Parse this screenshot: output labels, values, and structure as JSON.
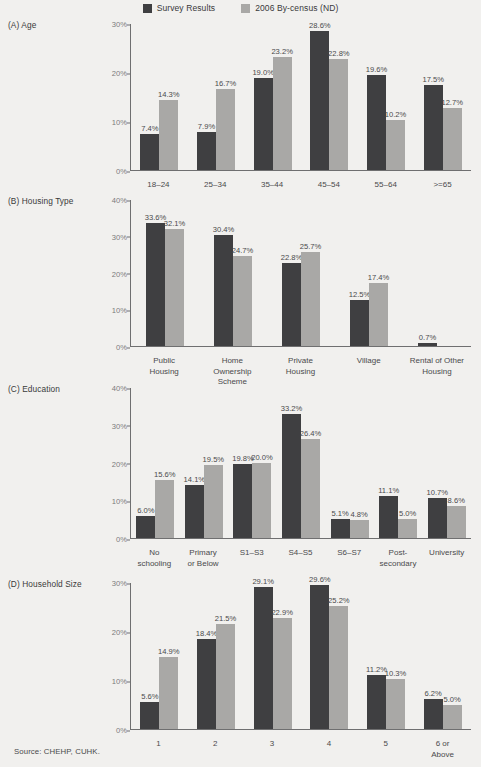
{
  "legend": {
    "items": [
      {
        "label": "Survey Results",
        "color": "#3f3f41",
        "icon": "square-swatch-dark"
      },
      {
        "label": "2006 By-census (ND)",
        "color": "#a9a8a6",
        "icon": "square-swatch-light"
      }
    ]
  },
  "source": "Source: CHEHP, CUHK.",
  "chart_data": [
    {
      "type": "bar",
      "id": "panel-a-age",
      "title": "(A) Age",
      "xlabel": "",
      "ylabel": "",
      "ylim": [
        0,
        30
      ],
      "yticks": [
        "0%",
        "10%",
        "20%",
        "30%"
      ],
      "ytick_values": [
        0,
        10,
        20,
        30
      ],
      "grid": false,
      "legend_position": "top-center",
      "categories": [
        "18–24",
        "25–34",
        "35–44",
        "45–54",
        "55–64",
        ">=65"
      ],
      "series": [
        {
          "name": "Survey Results",
          "color": "#3f3f41",
          "values": [
            7.4,
            7.9,
            19.0,
            28.6,
            19.6,
            17.5
          ],
          "labels": [
            "7.4%",
            "7.9%",
            "19.0%",
            "28.6%",
            "19.6%",
            "17.5%"
          ]
        },
        {
          "name": "2006 By-census (ND)",
          "color": "#a9a8a6",
          "values": [
            14.3,
            16.7,
            23.2,
            22.8,
            10.2,
            12.7
          ],
          "labels": [
            "14.3%",
            "16.7%",
            "23.2%",
            "22.8%",
            "10.2%",
            "12.7%"
          ]
        }
      ]
    },
    {
      "type": "bar",
      "id": "panel-b-housing-type",
      "title": "(B) Housing Type",
      "xlabel": "",
      "ylabel": "",
      "ylim": [
        0,
        40
      ],
      "yticks": [
        "0%",
        "10%",
        "20%",
        "30%",
        "40%"
      ],
      "ytick_values": [
        0,
        10,
        20,
        30,
        40
      ],
      "grid": false,
      "categories": [
        "Public\nHousing",
        "Home\nOwnership\nScheme",
        "Private\nHousing",
        "Village",
        "Rental of Other\nHousing"
      ],
      "series": [
        {
          "name": "Survey Results",
          "color": "#3f3f41",
          "values": [
            33.6,
            30.4,
            22.8,
            12.5,
            0.7
          ],
          "labels": [
            "33.6%",
            "30.4%",
            "22.8%",
            "12.5%",
            "0.7%"
          ]
        },
        {
          "name": "2006 By-census (ND)",
          "color": "#a9a8a6",
          "values": [
            32.1,
            24.7,
            25.7,
            17.4,
            0
          ],
          "labels": [
            "32.1%",
            "24.7%",
            "25.7%",
            "17.4%",
            ""
          ]
        }
      ]
    },
    {
      "type": "bar",
      "id": "panel-c-education",
      "title": "(C) Education",
      "xlabel": "",
      "ylabel": "",
      "ylim": [
        0,
        40
      ],
      "yticks": [
        "0%",
        "10%",
        "20%",
        "30%",
        "40%"
      ],
      "ytick_values": [
        0,
        10,
        20,
        30,
        40
      ],
      "grid": false,
      "categories": [
        "No\nschooling",
        "Primary\nor Below",
        "S1–S3",
        "S4–S5",
        "S6–S7",
        "Post-\nsecondary",
        "University"
      ],
      "series": [
        {
          "name": "Survey Results",
          "color": "#3f3f41",
          "values": [
            6.0,
            14.1,
            19.8,
            33.2,
            5.1,
            11.1,
            10.7
          ],
          "labels": [
            "6.0%",
            "14.1%",
            "19.8%",
            "33.2%",
            "5.1%",
            "11.1%",
            "10.7%"
          ]
        },
        {
          "name": "2006 By-census (ND)",
          "color": "#a9a8a6",
          "values": [
            15.6,
            19.5,
            20.0,
            26.4,
            4.8,
            5.0,
            8.6
          ],
          "labels": [
            "15.6%",
            "19.5%",
            "20.0%",
            "26.4%",
            "4.8%",
            "5.0%",
            "8.6%"
          ]
        }
      ]
    },
    {
      "type": "bar",
      "id": "panel-d-household-size",
      "title": "(D) Household Size",
      "xlabel": "",
      "ylabel": "",
      "ylim": [
        0,
        30
      ],
      "yticks": [
        "0%",
        "10%",
        "20%",
        "30%"
      ],
      "ytick_values": [
        0,
        10,
        20,
        30
      ],
      "grid": false,
      "categories": [
        "1",
        "2",
        "3",
        "4",
        "5",
        "6 or\nAbove"
      ],
      "series": [
        {
          "name": "Survey Results",
          "color": "#3f3f41",
          "values": [
            5.6,
            18.4,
            29.1,
            29.6,
            11.2,
            6.2
          ],
          "labels": [
            "5.6%",
            "18.4%",
            "29.1%",
            "29.6%",
            "11.2%",
            "6.2%"
          ]
        },
        {
          "name": "2006 By-census (ND)",
          "color": "#a9a8a6",
          "values": [
            14.9,
            21.5,
            22.9,
            25.2,
            10.3,
            5.0
          ],
          "labels": [
            "14.9%",
            "21.5%",
            "22.9%",
            "25.2%",
            "10.3%",
            "5.0%"
          ]
        }
      ]
    }
  ]
}
